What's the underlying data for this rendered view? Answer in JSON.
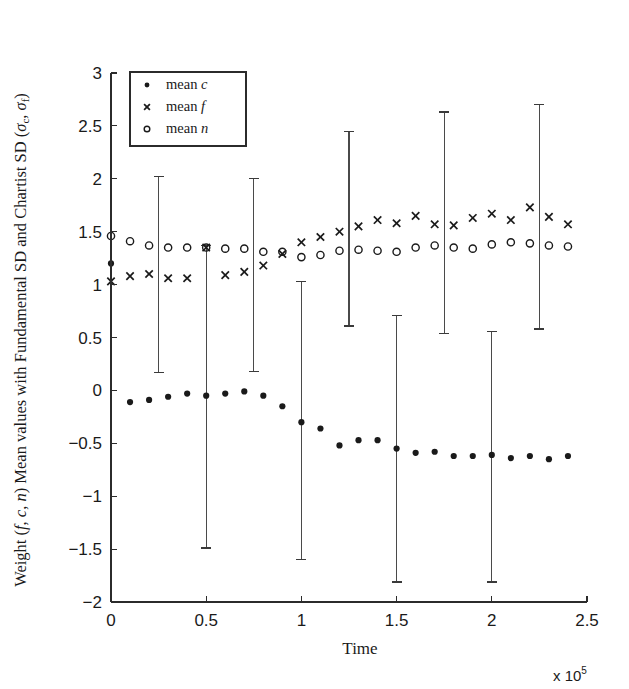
{
  "chart_data": {
    "type": "scatter",
    "title": "",
    "xlabel": "Time",
    "ylabel": "Weight (f, c, n) Mean values with Fundamental SD and Chartist SD (σc, σf)",
    "x_multiplier": "x 10",
    "x_multiplier_exp": "5",
    "xlim": [
      0,
      2.5
    ],
    "ylim": [
      -2,
      3
    ],
    "xticks": [
      0,
      0.5,
      1,
      1.5,
      2,
      2.5
    ],
    "xtick_labels": [
      "0",
      "0.5",
      "1",
      "1.5",
      "2",
      "2.5"
    ],
    "yticks": [
      -2,
      -1.5,
      -1,
      -0.5,
      0,
      0.5,
      1,
      1.5,
      2,
      2.5,
      3
    ],
    "ytick_labels": [
      "−2",
      "−1.5",
      "−1",
      "−0.5",
      "0",
      "0.5",
      "1",
      "1.5",
      "2",
      "2.5",
      "3"
    ],
    "grid": false,
    "legend_position": "top-left",
    "legend": [
      {
        "label_prefix": "mean",
        "label_symbol": "c",
        "marker": "dot"
      },
      {
        "label_prefix": "mean",
        "label_symbol": "f",
        "marker": "x"
      },
      {
        "label_prefix": "mean",
        "label_symbol": "n",
        "marker": "circle"
      }
    ],
    "x": [
      0.0,
      0.1,
      0.2,
      0.3,
      0.4,
      0.5,
      0.6,
      0.7,
      0.8,
      0.9,
      1.0,
      1.1,
      1.2,
      1.3,
      1.4,
      1.5,
      1.6,
      1.7,
      1.8,
      1.9,
      2.0,
      2.1,
      2.2,
      2.3,
      2.4
    ],
    "series": [
      {
        "name": "mean c",
        "marker": "dot",
        "values": [
          1.2,
          -0.11,
          -0.09,
          -0.06,
          -0.03,
          -0.05,
          -0.03,
          -0.01,
          -0.05,
          -0.15,
          -0.3,
          -0.36,
          -0.52,
          -0.47,
          -0.47,
          -0.55,
          -0.59,
          -0.58,
          -0.62,
          -0.62,
          -0.61,
          -0.64,
          -0.62,
          -0.65,
          -0.62
        ]
      },
      {
        "name": "mean f",
        "marker": "x",
        "values": [
          1.03,
          1.08,
          1.1,
          1.06,
          1.06,
          1.35,
          1.09,
          1.12,
          1.18,
          1.29,
          1.4,
          1.45,
          1.5,
          1.55,
          1.61,
          1.58,
          1.65,
          1.57,
          1.56,
          1.63,
          1.67,
          1.61,
          1.73,
          1.64,
          1.57
        ]
      },
      {
        "name": "mean n",
        "marker": "circle",
        "values": [
          1.46,
          1.41,
          1.37,
          1.35,
          1.35,
          1.35,
          1.34,
          1.34,
          1.31,
          1.31,
          1.26,
          1.28,
          1.32,
          1.33,
          1.32,
          1.31,
          1.35,
          1.37,
          1.35,
          1.34,
          1.38,
          1.4,
          1.39,
          1.37,
          1.36
        ]
      }
    ],
    "error_bars": [
      {
        "x": 0.25,
        "center": 1.1,
        "lower": 0.17,
        "upper": 2.02
      },
      {
        "x": 0.5,
        "center": 1.35,
        "lower": -1.49,
        "upper": 1.37
      },
      {
        "x": 0.75,
        "center": 1.13,
        "lower": 0.18,
        "upper": 2.0
      },
      {
        "x": 1.0,
        "center": -0.3,
        "lower": -1.6,
        "upper": 1.03
      },
      {
        "x": 1.25,
        "center": 1.55,
        "lower": 0.61,
        "upper": 2.45
      },
      {
        "x": 1.5,
        "center": -0.55,
        "lower": -1.81,
        "upper": 0.71
      },
      {
        "x": 1.75,
        "center": 1.58,
        "lower": 0.54,
        "upper": 2.63
      },
      {
        "x": 2.0,
        "center": -0.61,
        "lower": -1.81,
        "upper": 0.56
      },
      {
        "x": 2.25,
        "center": 1.65,
        "lower": 0.58,
        "upper": 2.7
      }
    ]
  }
}
